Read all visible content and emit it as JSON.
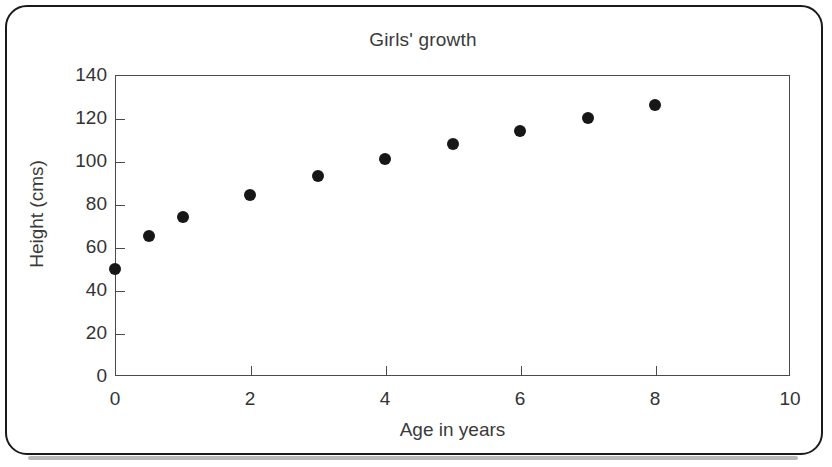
{
  "chart_data": {
    "type": "scatter",
    "title": "Girls' growth",
    "xlabel": "Age in years",
    "ylabel": "Height (cms)",
    "xlim": [
      0,
      10
    ],
    "ylim": [
      0,
      140
    ],
    "xticks": [
      "0",
      "2",
      "4",
      "6",
      "8",
      "10"
    ],
    "xtick_values": [
      0,
      2,
      4,
      6,
      8,
      10
    ],
    "yticks": [
      "0",
      "20",
      "40",
      "60",
      "80",
      "100",
      "120",
      "140"
    ],
    "ytick_values": [
      0,
      20,
      40,
      60,
      80,
      100,
      120,
      140
    ],
    "grid": false,
    "legend": "none",
    "marker": "filled-circle",
    "marker_color": "#171717",
    "x": [
      0,
      0.5,
      1,
      2,
      3,
      4,
      5,
      6,
      7,
      8
    ],
    "values": [
      50,
      65,
      74,
      84,
      93,
      101,
      108,
      114,
      120,
      126
    ],
    "points": [
      {
        "x": 0,
        "y": 50
      },
      {
        "x": 0.5,
        "y": 65
      },
      {
        "x": 1,
        "y": 74
      },
      {
        "x": 2,
        "y": 84
      },
      {
        "x": 3,
        "y": 93
      },
      {
        "x": 4,
        "y": 101
      },
      {
        "x": 5,
        "y": 108
      },
      {
        "x": 6,
        "y": 114
      },
      {
        "x": 7,
        "y": 120
      },
      {
        "x": 8,
        "y": 126
      }
    ]
  },
  "colors": {
    "card_border": "#1a1a1a",
    "axis": "#4a4a4a",
    "text": "#333333",
    "marker": "#171717",
    "shadow": "#b9b9b9"
  }
}
